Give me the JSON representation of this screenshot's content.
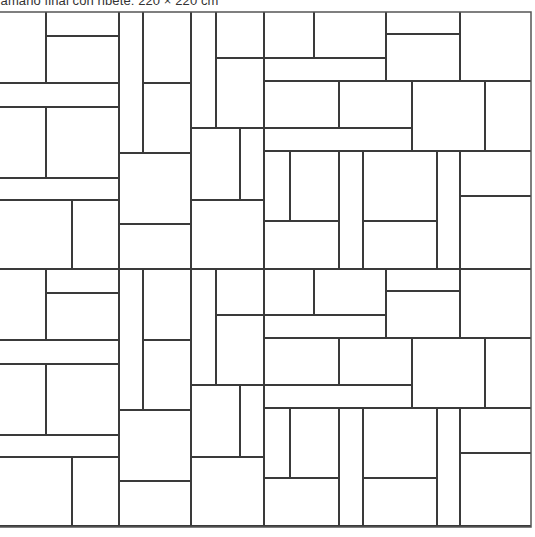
{
  "caption": "Tamaño final con ribete: 220 × 220 cm",
  "diagram": {
    "type": "quilt-block-layout",
    "stroke_color": "#3a3a3a",
    "background": "#ffffff",
    "outer_border": {
      "x1": -10,
      "y1": 12,
      "x2": 531,
      "y2": 527
    },
    "block_rows": [
      {
        "y_offset": 0
      },
      {
        "y_offset": 257
      }
    ],
    "verticals": [
      [
        46,
        12,
        83
      ],
      [
        46,
        107,
        178
      ],
      [
        72,
        200,
        269
      ],
      [
        119,
        12,
        269
      ],
      [
        143,
        12,
        153
      ],
      [
        191,
        12,
        269
      ],
      [
        216,
        12,
        128
      ],
      [
        240,
        128,
        200
      ],
      [
        264,
        12,
        269
      ],
      [
        314,
        12,
        58
      ],
      [
        386,
        12,
        81
      ],
      [
        460,
        12,
        81
      ],
      [
        339,
        81,
        128
      ],
      [
        412,
        81,
        151
      ],
      [
        485,
        81,
        151
      ],
      [
        290,
        151,
        221
      ],
      [
        339,
        151,
        269
      ],
      [
        363,
        151,
        269
      ],
      [
        437,
        151,
        269
      ],
      [
        460,
        151,
        269
      ]
    ],
    "horizontals": [
      [
        36,
        46,
        119
      ],
      [
        83,
        -10,
        119
      ],
      [
        107,
        -10,
        119
      ],
      [
        178,
        -10,
        119
      ],
      [
        200,
        -10,
        119
      ],
      [
        83,
        143,
        191
      ],
      [
        153,
        119,
        191
      ],
      [
        224,
        119,
        191
      ],
      [
        58,
        216,
        386
      ],
      [
        128,
        191,
        412
      ],
      [
        200,
        191,
        264
      ],
      [
        34,
        386,
        460
      ],
      [
        81,
        264,
        531
      ],
      [
        151,
        264,
        531
      ],
      [
        196,
        460,
        531
      ],
      [
        221,
        264,
        339
      ],
      [
        221,
        363,
        437
      ],
      [
        269,
        -10,
        531
      ]
    ]
  }
}
